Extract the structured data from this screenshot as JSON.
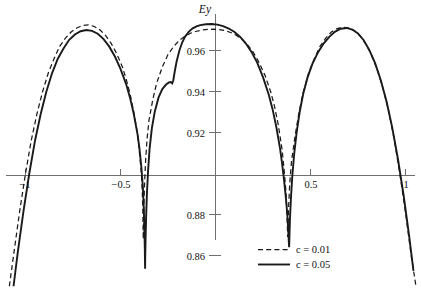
{
  "chart_data": {
    "type": "line",
    "title": "",
    "xlabel": "",
    "ylabel": "Ey",
    "xlim": [
      -1.13,
      1.09
    ],
    "ylim": [
      0.845,
      0.978
    ],
    "grid": false,
    "legend_position": "bottom-right",
    "xticks": [
      -1,
      -0.5,
      0.5,
      1
    ],
    "xtick_labels": [
      "−1",
      "−0.5",
      "0.5",
      "1"
    ],
    "yticks": [
      0.86,
      0.88,
      0.92,
      0.94,
      0.96
    ],
    "ytick_labels": [
      "0.86",
      "0.88",
      "0.92",
      "0.94",
      "0.96"
    ],
    "series": [
      {
        "name": "c = 0.01",
        "style": "dashed",
        "color": "#1a1a1a",
        "points": [
          [
            -1.085,
            0.845
          ],
          [
            -1.06,
            0.862
          ],
          [
            -1.03,
            0.882
          ],
          [
            -1.0,
            0.9
          ],
          [
            -0.97,
            0.916
          ],
          [
            -0.94,
            0.929
          ],
          [
            -0.91,
            0.94
          ],
          [
            -0.88,
            0.949
          ],
          [
            -0.85,
            0.956
          ],
          [
            -0.82,
            0.962
          ],
          [
            -0.79,
            0.966
          ],
          [
            -0.76,
            0.969
          ],
          [
            -0.73,
            0.971
          ],
          [
            -0.7,
            0.9722
          ],
          [
            -0.67,
            0.9725
          ],
          [
            -0.64,
            0.9718
          ],
          [
            -0.61,
            0.9702
          ],
          [
            -0.58,
            0.9675
          ],
          [
            -0.55,
            0.9636
          ],
          [
            -0.52,
            0.9585
          ],
          [
            -0.49,
            0.952
          ],
          [
            -0.47,
            0.946
          ],
          [
            -0.45,
            0.939
          ],
          [
            -0.43,
            0.93
          ],
          [
            -0.41,
            0.919
          ],
          [
            -0.4,
            0.91
          ],
          [
            -0.39,
            0.9
          ],
          [
            -0.385,
            0.89
          ],
          [
            -0.382,
            0.88
          ],
          [
            -0.381,
            0.872
          ],
          [
            -0.38,
            0.868
          ],
          [
            -0.379,
            0.874
          ],
          [
            -0.377,
            0.884
          ],
          [
            -0.373,
            0.896
          ],
          [
            -0.368,
            0.906
          ],
          [
            -0.36,
            0.917
          ],
          [
            -0.35,
            0.926
          ],
          [
            -0.33,
            0.936
          ],
          [
            -0.31,
            0.944
          ],
          [
            -0.28,
            0.952
          ],
          [
            -0.25,
            0.958
          ],
          [
            -0.22,
            0.962
          ],
          [
            -0.19,
            0.965
          ],
          [
            -0.16,
            0.967
          ],
          [
            -0.13,
            0.9685
          ],
          [
            -0.1,
            0.9694
          ],
          [
            -0.07,
            0.97
          ],
          [
            -0.04,
            0.9703
          ],
          [
            -0.01,
            0.9704
          ],
          [
            0.02,
            0.9702
          ],
          [
            0.05,
            0.9697
          ],
          [
            0.08,
            0.9688
          ],
          [
            0.11,
            0.9674
          ],
          [
            0.14,
            0.9654
          ],
          [
            0.17,
            0.9626
          ],
          [
            0.2,
            0.959
          ],
          [
            0.23,
            0.954
          ],
          [
            0.26,
            0.948
          ],
          [
            0.29,
            0.94
          ],
          [
            0.31,
            0.933
          ],
          [
            0.33,
            0.924
          ],
          [
            0.35,
            0.912
          ],
          [
            0.36,
            0.903
          ],
          [
            0.37,
            0.892
          ],
          [
            0.375,
            0.883
          ],
          [
            0.378,
            0.875
          ],
          [
            0.38,
            0.869
          ],
          [
            0.382,
            0.875
          ],
          [
            0.385,
            0.884
          ],
          [
            0.39,
            0.894
          ],
          [
            0.4,
            0.906
          ],
          [
            0.42,
            0.919
          ],
          [
            0.44,
            0.93
          ],
          [
            0.46,
            0.939
          ],
          [
            0.49,
            0.949
          ],
          [
            0.52,
            0.956
          ],
          [
            0.55,
            0.962
          ],
          [
            0.58,
            0.966
          ],
          [
            0.61,
            0.969
          ],
          [
            0.64,
            0.9707
          ],
          [
            0.67,
            0.9714
          ],
          [
            0.7,
            0.9711
          ],
          [
            0.73,
            0.9697
          ],
          [
            0.76,
            0.9672
          ],
          [
            0.79,
            0.9634
          ],
          [
            0.82,
            0.958
          ],
          [
            0.85,
            0.951
          ],
          [
            0.88,
            0.942
          ],
          [
            0.91,
            0.931
          ],
          [
            0.94,
            0.917
          ],
          [
            0.97,
            0.9
          ],
          [
            1.0,
            0.881
          ],
          [
            1.03,
            0.86
          ],
          [
            1.055,
            0.845
          ]
        ]
      },
      {
        "name": "c = 0.05",
        "style": "solid",
        "color": "#1a1a1a",
        "points": [
          [
            -1.063,
            0.845
          ],
          [
            -1.04,
            0.862
          ],
          [
            -1.01,
            0.882
          ],
          [
            -0.98,
            0.9
          ],
          [
            -0.95,
            0.916
          ],
          [
            -0.92,
            0.929
          ],
          [
            -0.89,
            0.94
          ],
          [
            -0.86,
            0.949
          ],
          [
            -0.83,
            0.956
          ],
          [
            -0.8,
            0.961
          ],
          [
            -0.77,
            0.9652
          ],
          [
            -0.74,
            0.9678
          ],
          [
            -0.71,
            0.9694
          ],
          [
            -0.68,
            0.97
          ],
          [
            -0.65,
            0.9696
          ],
          [
            -0.62,
            0.9682
          ],
          [
            -0.59,
            0.9657
          ],
          [
            -0.56,
            0.962
          ],
          [
            -0.53,
            0.9572
          ],
          [
            -0.5,
            0.951
          ],
          [
            -0.47,
            0.9435
          ],
          [
            -0.45,
            0.937
          ],
          [
            -0.43,
            0.929
          ],
          [
            -0.41,
            0.919
          ],
          [
            -0.4,
            0.912
          ],
          [
            -0.39,
            0.903
          ],
          [
            -0.382,
            0.893
          ],
          [
            -0.377,
            0.882
          ],
          [
            -0.374,
            0.872
          ],
          [
            -0.372,
            0.863
          ],
          [
            -0.371,
            0.856
          ],
          [
            -0.3705,
            0.8535
          ],
          [
            -0.37,
            0.858
          ],
          [
            -0.368,
            0.868
          ],
          [
            -0.365,
            0.879
          ],
          [
            -0.361,
            0.89
          ],
          [
            -0.355,
            0.901
          ],
          [
            -0.347,
            0.912
          ],
          [
            -0.335,
            0.922
          ],
          [
            -0.32,
            0.93
          ],
          [
            -0.3,
            0.937
          ],
          [
            -0.28,
            0.9412
          ],
          [
            -0.26,
            0.9434
          ],
          [
            -0.245,
            0.9444
          ],
          [
            -0.235,
            0.9446
          ],
          [
            -0.228,
            0.944
          ],
          [
            -0.222,
            0.9455
          ],
          [
            -0.215,
            0.9495
          ],
          [
            -0.205,
            0.9545
          ],
          [
            -0.19,
            0.96
          ],
          [
            -0.175,
            0.964
          ],
          [
            -0.16,
            0.9668
          ],
          [
            -0.14,
            0.9692
          ],
          [
            -0.12,
            0.9708
          ],
          [
            -0.1,
            0.9718
          ],
          [
            -0.08,
            0.9724
          ],
          [
            -0.05,
            0.9728
          ],
          [
            -0.02,
            0.9729
          ],
          [
            0.01,
            0.9726
          ],
          [
            0.04,
            0.9719
          ],
          [
            0.07,
            0.9707
          ],
          [
            0.1,
            0.969
          ],
          [
            0.13,
            0.9666
          ],
          [
            0.16,
            0.9634
          ],
          [
            0.19,
            0.9592
          ],
          [
            0.22,
            0.954
          ],
          [
            0.25,
            0.947
          ],
          [
            0.28,
            0.9385
          ],
          [
            0.3,
            0.9315
          ],
          [
            0.32,
            0.9228
          ],
          [
            0.34,
            0.912
          ],
          [
            0.35,
            0.9052
          ],
          [
            0.36,
            0.8975
          ],
          [
            0.37,
            0.8885
          ],
          [
            0.378,
            0.88
          ],
          [
            0.383,
            0.872
          ],
          [
            0.386,
            0.8665
          ],
          [
            0.3875,
            0.864
          ],
          [
            0.389,
            0.869
          ],
          [
            0.392,
            0.878
          ],
          [
            0.397,
            0.888
          ],
          [
            0.404,
            0.8985
          ],
          [
            0.414,
            0.9095
          ],
          [
            0.427,
            0.92
          ],
          [
            0.443,
            0.93
          ],
          [
            0.462,
            0.939
          ],
          [
            0.485,
            0.947
          ],
          [
            0.51,
            0.9535
          ],
          [
            0.54,
            0.9592
          ],
          [
            0.57,
            0.9635
          ],
          [
            0.6,
            0.9668
          ],
          [
            0.63,
            0.9692
          ],
          [
            0.66,
            0.9706
          ],
          [
            0.69,
            0.971
          ],
          [
            0.72,
            0.9702
          ],
          [
            0.75,
            0.9683
          ],
          [
            0.78,
            0.965
          ],
          [
            0.81,
            0.9602
          ],
          [
            0.84,
            0.9538
          ],
          [
            0.87,
            0.9455
          ],
          [
            0.9,
            0.9352
          ],
          [
            0.93,
            0.9225
          ],
          [
            0.96,
            0.9072
          ],
          [
            0.99,
            0.8895
          ],
          [
            1.02,
            0.869
          ],
          [
            1.042,
            0.8525
          ]
        ]
      }
    ]
  },
  "legend": {
    "items": [
      {
        "label": "c = 0.01",
        "style": "dashed"
      },
      {
        "label": "c = 0.05",
        "style": "solid"
      }
    ]
  }
}
